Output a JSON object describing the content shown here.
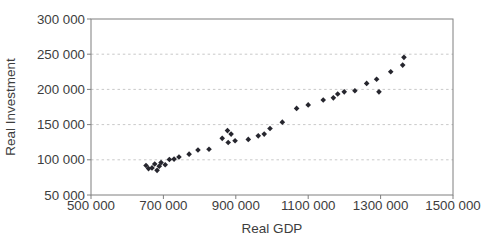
{
  "chart_data": {
    "type": "scatter",
    "title": "",
    "xlabel": "Real GDP",
    "ylabel": "Real Investment",
    "xlim": [
      500000,
      1500000
    ],
    "ylim": [
      50000,
      300000
    ],
    "x_tick_values": [
      500000,
      700000,
      900000,
      1100000,
      1300000,
      1500000
    ],
    "x_tick_labels": [
      "500 000",
      "700 000",
      "900 000",
      "1100 000",
      "1300 000",
      "1500 000"
    ],
    "y_tick_values": [
      50000,
      100000,
      150000,
      200000,
      250000,
      300000
    ],
    "y_tick_labels": [
      "50 000",
      "100 000",
      "150 000",
      "200 000",
      "250 000",
      "300 000"
    ],
    "grid": "horizontal-dashed",
    "legend": "none",
    "marker": {
      "shape": "diamond",
      "color": "#26262e",
      "size": 5.6
    },
    "colors": {
      "background": "#ffffff",
      "plot_border": "#7f7f7f",
      "gridline": "#c9c9c9",
      "tick": "#7f7f7f",
      "text": "#3d3d3d"
    },
    "points": [
      [
        652000,
        92000
      ],
      [
        659000,
        87500
      ],
      [
        668500,
        88500
      ],
      [
        676000,
        94000
      ],
      [
        682500,
        85000
      ],
      [
        688500,
        91000
      ],
      [
        693500,
        96000
      ],
      [
        705000,
        93000
      ],
      [
        716500,
        100500
      ],
      [
        729500,
        101000
      ],
      [
        743000,
        104000
      ],
      [
        771000,
        108000
      ],
      [
        795500,
        114000
      ],
      [
        826000,
        115000
      ],
      [
        862500,
        130500
      ],
      [
        877000,
        141500
      ],
      [
        879000,
        124500
      ],
      [
        887000,
        136500
      ],
      [
        898000,
        127000
      ],
      [
        934500,
        129000
      ],
      [
        962000,
        134000
      ],
      [
        978500,
        136500
      ],
      [
        994500,
        144500
      ],
      [
        1028500,
        153500
      ],
      [
        1068000,
        173000
      ],
      [
        1100000,
        178000
      ],
      [
        1141500,
        185000
      ],
      [
        1169500,
        188000
      ],
      [
        1181500,
        193500
      ],
      [
        1199500,
        196500
      ],
      [
        1229000,
        198000
      ],
      [
        1261500,
        208500
      ],
      [
        1289000,
        214500
      ],
      [
        1295500,
        196500
      ],
      [
        1328000,
        225000
      ],
      [
        1361000,
        234500
      ],
      [
        1364500,
        245500
      ]
    ]
  }
}
